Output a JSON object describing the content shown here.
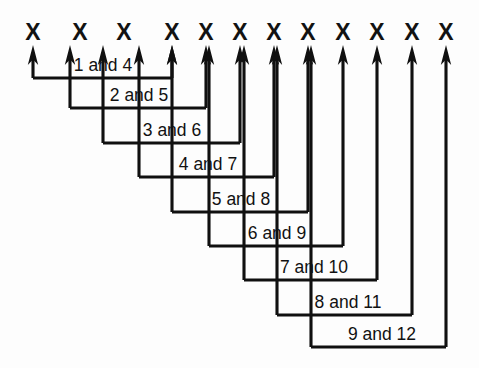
{
  "figure": {
    "background_color": "#fdfdfd",
    "ink_color": "#101010",
    "width": 479,
    "height": 368
  },
  "marks": {
    "glyph": "X",
    "count": 12,
    "baseline_y": 40,
    "positions_x": [
      33,
      80,
      124,
      172,
      206,
      240,
      274,
      308,
      343,
      377,
      412,
      446
    ],
    "labels": [
      "1",
      "2",
      "3",
      "4",
      "5",
      "6",
      "7",
      "8",
      "9",
      "10",
      "11",
      "12"
    ]
  },
  "connectors": [
    {
      "label": "1 and 4",
      "from_mark": 1,
      "to_mark": 4,
      "left_x": 33,
      "right_x": 172,
      "bottom_y": 78,
      "label_x": 103,
      "label_baseline_y": 71
    },
    {
      "label": "2 and 5",
      "from_mark": 2,
      "to_mark": 5,
      "left_x": 70,
      "right_x": 206,
      "bottom_y": 108,
      "label_x": 139,
      "label_baseline_y": 101
    },
    {
      "label": "3 and 6",
      "from_mark": 3,
      "to_mark": 6,
      "left_x": 103,
      "right_x": 240,
      "bottom_y": 143,
      "label_x": 172,
      "label_baseline_y": 136
    },
    {
      "label": "4 and 7",
      "from_mark": 4,
      "to_mark": 7,
      "left_x": 139,
      "right_x": 274,
      "bottom_y": 177,
      "label_x": 208,
      "label_baseline_y": 170
    },
    {
      "label": "5 and 8",
      "from_mark": 5,
      "to_mark": 8,
      "left_x": 172,
      "right_x": 308,
      "bottom_y": 212,
      "label_x": 241,
      "label_baseline_y": 205
    },
    {
      "label": "6 and 9",
      "from_mark": 6,
      "to_mark": 9,
      "left_x": 209,
      "right_x": 343,
      "bottom_y": 246,
      "label_x": 277,
      "label_baseline_y": 239
    },
    {
      "label": "7 and 10",
      "from_mark": 7,
      "to_mark": 10,
      "left_x": 244,
      "right_x": 377,
      "bottom_y": 280,
      "label_x": 314,
      "label_baseline_y": 273
    },
    {
      "label": "8 and 11",
      "from_mark": 8,
      "to_mark": 11,
      "left_x": 277,
      "right_x": 412,
      "bottom_y": 315,
      "label_x": 348,
      "label_baseline_y": 308
    },
    {
      "label": "9 and 12",
      "from_mark": 9,
      "to_mark": 12,
      "left_x": 311,
      "right_x": 446,
      "bottom_y": 347,
      "label_x": 382,
      "label_baseline_y": 340
    }
  ],
  "arrow": {
    "head_half_width": 5.2,
    "head_height": 20,
    "tip_y": 45
  }
}
